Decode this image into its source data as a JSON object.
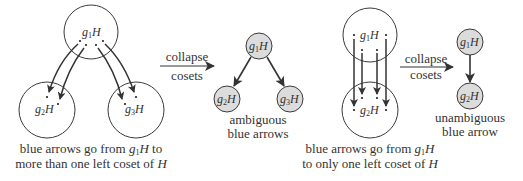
{
  "diagram": {
    "colors": {
      "stroke": "#3a3a3a",
      "arrow": "#333333",
      "node_fill": "#dcdcdc",
      "text": "#333333"
    },
    "left_panel": {
      "cosets": [
        {
          "id": "g1H",
          "label_base": "g",
          "label_sub": "1",
          "label_tail": "H"
        },
        {
          "id": "g2H",
          "label_base": "g",
          "label_sub": "2",
          "label_tail": "H"
        },
        {
          "id": "g3H",
          "label_base": "g",
          "label_sub": "3",
          "label_tail": "H"
        }
      ],
      "arrows": [
        {
          "from": "g1H",
          "to": "g2H"
        },
        {
          "from": "g1H",
          "to": "g2H"
        },
        {
          "from": "g1H",
          "to": "g3H"
        },
        {
          "from": "g1H",
          "to": "g3H"
        }
      ],
      "caption_line1_prefix": "blue arrows go from ",
      "caption_line1_g": "g",
      "caption_line1_sub": "1",
      "caption_line1_H": "H",
      "caption_line1_suffix": " to",
      "caption_line2_prefix": "more than one left coset of ",
      "caption_line2_H": "H"
    },
    "collapse_arrow_1": {
      "line1": "collapse",
      "line2": "cosets"
    },
    "middle_panel": {
      "nodes": [
        {
          "id": "g1H",
          "label_base": "g",
          "label_sub": "1",
          "label_tail": "H"
        },
        {
          "id": "g2H",
          "label_base": "g",
          "label_sub": "2",
          "label_tail": "H"
        },
        {
          "id": "g3H",
          "label_base": "g",
          "label_sub": "3",
          "label_tail": "H"
        }
      ],
      "edges": [
        {
          "from": "g1H",
          "to": "g2H"
        },
        {
          "from": "g1H",
          "to": "g3H"
        }
      ],
      "caption_line1": "ambiguous",
      "caption_line2": "blue arrows"
    },
    "right_panel": {
      "cosets": [
        {
          "id": "g1H",
          "label_base": "g",
          "label_sub": "1",
          "label_tail": "H"
        },
        {
          "id": "g2H",
          "label_base": "g",
          "label_sub": "2",
          "label_tail": "H"
        }
      ],
      "arrows": [
        {
          "from": "g1H",
          "to": "g2H"
        },
        {
          "from": "g1H",
          "to": "g2H"
        },
        {
          "from": "g1H",
          "to": "g2H"
        },
        {
          "from": "g1H",
          "to": "g2H"
        }
      ],
      "caption_line1_prefix": "blue arrows go from ",
      "caption_line1_g": "g",
      "caption_line1_sub": "1",
      "caption_line1_H": "H",
      "caption_line2_prefix": "to only one left coset of ",
      "caption_line2_H": "H"
    },
    "collapse_arrow_2": {
      "line1": "collapse",
      "line2": "cosets"
    },
    "far_right_panel": {
      "nodes": [
        {
          "id": "g1H",
          "label_base": "g",
          "label_sub": "1",
          "label_tail": "H"
        },
        {
          "id": "g2H",
          "label_base": "g",
          "label_sub": "2",
          "label_tail": "H"
        }
      ],
      "edges": [
        {
          "from": "g1H",
          "to": "g2H"
        }
      ],
      "caption_line1": "unambiguous",
      "caption_line2": "blue arrow"
    }
  }
}
